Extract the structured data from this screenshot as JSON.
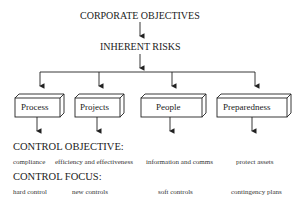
{
  "diagram": {
    "top": "CORPORATE OBJECTIVES",
    "middle": "INHERENT RISKS",
    "categories": [
      {
        "label": "Process",
        "objective": "compliance",
        "focus": "hard control"
      },
      {
        "label": "Projects",
        "objective": "efficiency and effectiveness",
        "focus": "new controls"
      },
      {
        "label": "People",
        "objective": "information and comms",
        "focus": "soft controls"
      },
      {
        "label": "Preparedness",
        "objective": "protect assets",
        "focus": "contingency plans"
      }
    ],
    "control_objective_heading": "CONTROL OBJECTIVE:",
    "control_focus_heading": "CONTROL FOCUS:"
  }
}
